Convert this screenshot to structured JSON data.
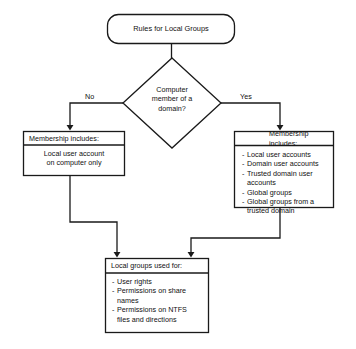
{
  "diagram": {
    "title_node": {
      "label": "Rules for Local Groups",
      "shape": "rounded-rectangle"
    },
    "decision_node": {
      "label": "Computer member of a domain?",
      "line1": "Computer",
      "line2": "member of a",
      "line3": "domain?",
      "shape": "diamond"
    },
    "edge_labels": {
      "no": "No",
      "yes": "Yes"
    },
    "no_branch_node": {
      "header": "Membership includes:",
      "body_line1": "Local user account",
      "body_line2": "on computer only",
      "shape": "rectangle"
    },
    "yes_branch_node": {
      "header": "Membership includes:",
      "items": [
        {
          "dash": "-",
          "text": "Local user accounts",
          "continuation": false
        },
        {
          "dash": "-",
          "text": "Domain user accounts",
          "continuation": false
        },
        {
          "dash": "-",
          "text": "Trusted domain user",
          "continuation": false
        },
        {
          "dash": "",
          "text": "accounts",
          "continuation": true
        },
        {
          "dash": "-",
          "text": "Global groups",
          "continuation": false
        },
        {
          "dash": "-",
          "text": "Global groups from a",
          "continuation": false
        },
        {
          "dash": "",
          "text": "trusted domain",
          "continuation": true
        }
      ],
      "shape": "rectangle"
    },
    "result_node": {
      "header": "Local groups used for:",
      "items": [
        {
          "dash": "-",
          "text": "User rights",
          "continuation": false
        },
        {
          "dash": "-",
          "text": "Permissions on share",
          "continuation": false
        },
        {
          "dash": "",
          "text": "names",
          "continuation": true
        },
        {
          "dash": "-",
          "text": "Permissions on NTFS",
          "continuation": false
        },
        {
          "dash": "",
          "text": "files and directions",
          "continuation": true
        }
      ],
      "shape": "rectangle"
    },
    "colors": {
      "background": "#ffffff",
      "stroke": "#1a1a1a",
      "node_fill": "#ffffff",
      "text": "#111111"
    }
  }
}
